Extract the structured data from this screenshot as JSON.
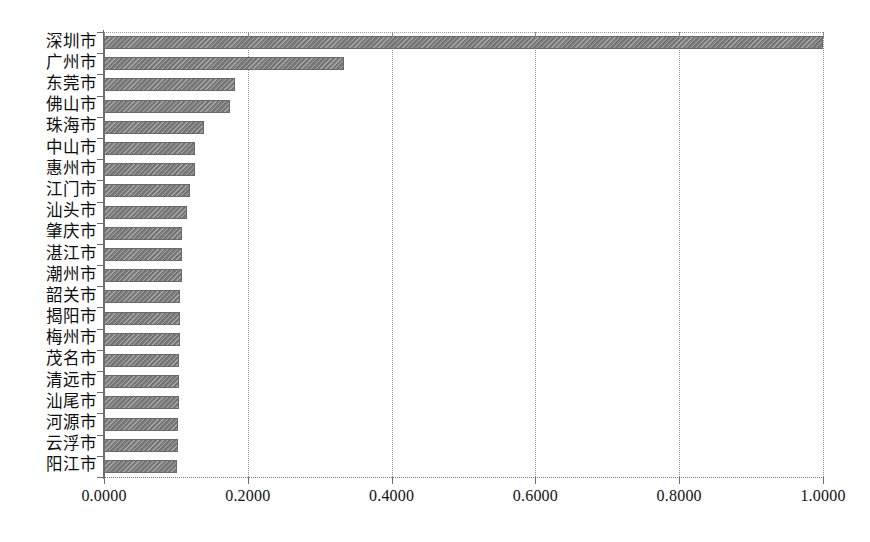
{
  "chart_data": {
    "type": "bar",
    "orientation": "horizontal",
    "title": "",
    "xlabel": "",
    "ylabel": "",
    "xlim": [
      0.0,
      1.0
    ],
    "grid": true,
    "legend": "none",
    "xticks": [
      0.0,
      0.2,
      0.4,
      0.6,
      0.8,
      1.0
    ],
    "xtick_labels": [
      "0.0000",
      "0.2000",
      "0.4000",
      "0.6000",
      "0.8000",
      "1.0000"
    ],
    "categories": [
      "深圳市",
      "广州市",
      "东莞市",
      "佛山市",
      "珠海市",
      "中山市",
      "惠州市",
      "江门市",
      "汕头市",
      "肇庆市",
      "湛江市",
      "潮州市",
      "韶关市",
      "揭阳市",
      "梅州市",
      "茂名市",
      "清远市",
      "汕尾市",
      "河源市",
      "云浮市",
      "阳江市"
    ],
    "values": [
      1.0,
      0.334,
      0.182,
      0.175,
      0.139,
      0.127,
      0.126,
      0.119,
      0.116,
      0.109,
      0.108,
      0.108,
      0.106,
      0.106,
      0.106,
      0.105,
      0.105,
      0.104,
      0.103,
      0.103,
      0.102
    ],
    "bar_color": "#7e7e7e",
    "bar_edge_color": "#6a6a6a",
    "grid_color": "#8f8f8f",
    "axis_color": "#6e6e6e",
    "background_color": "#ffffff"
  }
}
